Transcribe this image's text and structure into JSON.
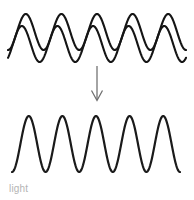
{
  "figure": {
    "caption": "light",
    "caption_color": "#b4b4b4",
    "background_color": "#ffffff",
    "stroke_color": "#151515",
    "arrow_color": "#6e6e6e",
    "width": 194,
    "height": 200
  },
  "chart_data": {
    "type": "line",
    "title": "light",
    "subtitle": "",
    "xlabel": "",
    "ylabel": "",
    "grid": false,
    "legend_position": "none",
    "annotations": [
      {
        "name": "down-arrow",
        "text": "",
        "from": [
          97,
          66
        ],
        "to": [
          97,
          100
        ],
        "color": "#6e6e6e"
      }
    ],
    "xlim": [
      0,
      194
    ],
    "ylim": [
      0,
      200
    ],
    "series": [
      {
        "name": "incoherent-wave-1",
        "group": "input-waves",
        "waveform": "sine",
        "cycles": 5,
        "x_start": 8,
        "x_end": 186,
        "baseline_y": 32,
        "amplitude": 18,
        "phase_deg": 0,
        "stroke": "#151515",
        "stroke_width": 2.1
      },
      {
        "name": "incoherent-wave-2",
        "group": "input-waves",
        "waveform": "sine",
        "cycles": 5,
        "x_start": 8,
        "x_end": 186,
        "baseline_y": 44,
        "amplitude": 18,
        "phase_deg": 40,
        "stroke": "#151515",
        "stroke_width": 2.1
      },
      {
        "name": "coherent-wave",
        "group": "output-wave",
        "waveform": "sine",
        "cycles": 5,
        "x_start": 12,
        "x_end": 180,
        "baseline_y": 144,
        "amplitude": 28,
        "phase_deg": 0,
        "stroke": "#1a1a1a",
        "stroke_width": 2.2
      }
    ]
  }
}
